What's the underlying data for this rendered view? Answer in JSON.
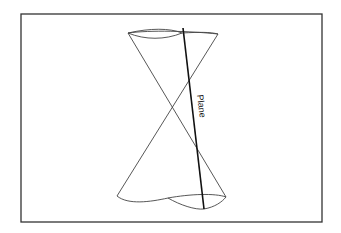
{
  "diagram": {
    "labels": {
      "plane": "Plane"
    },
    "colors": {
      "frame": "#333333",
      "cone": "#444444",
      "plane": "#111111",
      "background": "#ffffff"
    },
    "elements": [
      "frame",
      "upper-nappe",
      "lower-nappe",
      "plane-line",
      "plane-label"
    ]
  }
}
